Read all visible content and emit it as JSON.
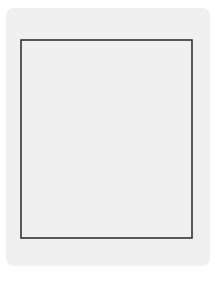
{
  "board": {
    "files_top": [
      "1",
      "2",
      "3",
      "4",
      "5",
      "6",
      "7",
      "8",
      "9"
    ],
    "files_bottom": [
      "九",
      "八",
      "七",
      "六",
      "五",
      "四",
      "三",
      "二",
      "一"
    ],
    "river_text": ""
  },
  "pieces": [
    {
      "char": "将",
      "side": "black",
      "col": 6,
      "row": 0
    },
    {
      "char": "马",
      "side": "red",
      "col": 4,
      "row": 2
    },
    {
      "char": "兵",
      "side": "red",
      "col": 3,
      "row": 5
    },
    {
      "char": "相",
      "side": "red",
      "col": 1,
      "row": 7
    },
    {
      "char": "帅",
      "side": "red",
      "col": 5,
      "row": 7
    },
    {
      "char": "车",
      "side": "red",
      "col": 9,
      "row": 8
    },
    {
      "char": "卒",
      "side": "black",
      "col": 1,
      "row": 9
    },
    {
      "char": "相",
      "side": "red",
      "col": 3,
      "row": 9
    }
  ],
  "caption": "第 550 题",
  "colors": {
    "black_piece": "#111111",
    "red_piece": "#5a5a5a",
    "grid": "#9a9a9a",
    "border": "#333333",
    "panel": "#f0f0f0"
  }
}
